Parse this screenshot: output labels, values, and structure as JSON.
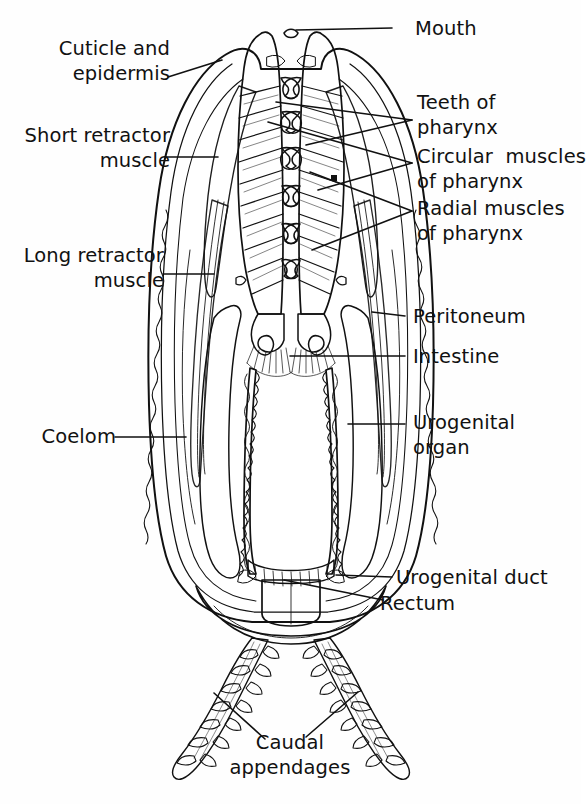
{
  "figure": {
    "organism": "priapulid worm",
    "view": "longitudinal / sagittal section",
    "style": "black and white pen-and-ink line drawing",
    "background_color": "#ffffff",
    "ink_color": "#111111"
  },
  "labels": {
    "mouth": "Mouth",
    "cuticle_and_epidermis": "Cuticle and\nepidermis",
    "short_retractor_muscle": "Short retractor\nmuscle",
    "long_retractor_muscle": "Long retractor\nmuscle",
    "coelom": "Coelom",
    "teeth_of_pharynx": "Teeth of\npharynx",
    "circular_muscles_of_pharynx": "Circular  muscles\nof pharynx",
    "radial_muscles_of_pharynx": "Radial muscles\nof pharynx",
    "peritoneum": "Peritoneum",
    "intestine": "Intestine",
    "urogenital_organ": "Urogenital\norgan",
    "urogenital_duct": "Urogenital duct",
    "rectum": "Rectum",
    "caudal_appendages": "Caudal\nappendages"
  },
  "label_list": [
    {
      "id": "mouth",
      "text": "Mouth",
      "side": "right",
      "lines": 1
    },
    {
      "id": "cuticle-and-epidermis",
      "text": "Cuticle and epidermis",
      "side": "left",
      "lines": 2
    },
    {
      "id": "short-retractor-muscle",
      "text": "Short retractor muscle",
      "side": "left",
      "lines": 2
    },
    {
      "id": "long-retractor-muscle",
      "text": "Long retractor muscle",
      "side": "left",
      "lines": 2
    },
    {
      "id": "coelom",
      "text": "Coelom",
      "side": "left",
      "lines": 1
    },
    {
      "id": "teeth-of-pharynx",
      "text": "Teeth of pharynx",
      "side": "right",
      "lines": 2
    },
    {
      "id": "circular-muscles-of-pharynx",
      "text": "Circular  muscles of pharynx",
      "side": "right",
      "lines": 2
    },
    {
      "id": "radial-muscles-of-pharynx",
      "text": "Radial muscles of pharynx",
      "side": "right",
      "lines": 2
    },
    {
      "id": "peritoneum",
      "text": "Peritoneum",
      "side": "right",
      "lines": 1
    },
    {
      "id": "intestine",
      "text": "Intestine",
      "side": "right",
      "lines": 1
    },
    {
      "id": "urogenital-organ",
      "text": "Urogenital organ",
      "side": "right",
      "lines": 2
    },
    {
      "id": "urogenital-duct",
      "text": "Urogenital duct",
      "side": "right",
      "lines": 1
    },
    {
      "id": "rectum",
      "text": "Rectum",
      "side": "right",
      "lines": 1
    },
    {
      "id": "caudal-appendages",
      "text": "Caudal appendages",
      "side": "bottom",
      "lines": 2
    }
  ],
  "structures": [
    "body wall cuticle",
    "epidermis",
    "short retractor muscle",
    "long retractor muscle",
    "coelom cavity",
    "everted pharynx with cuticular teeth",
    "circular muscles of pharynx",
    "radial muscles of pharynx",
    "peritoneum lining",
    "intestine",
    "paired urogenital organs",
    "urogenital duct",
    "rectum",
    "paired caudal appendages"
  ]
}
